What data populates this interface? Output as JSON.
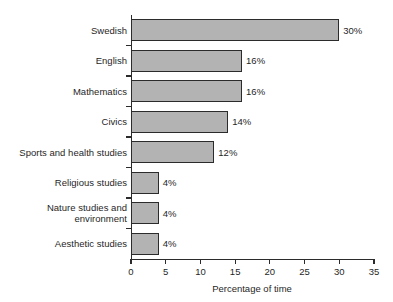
{
  "chart_data": {
    "type": "bar",
    "orientation": "horizontal",
    "title": "",
    "xlabel": "Percentage of time",
    "ylabel": "",
    "xlim": [
      0,
      35
    ],
    "xticks": [
      0,
      5,
      10,
      15,
      20,
      25,
      30,
      35
    ],
    "xtick_labels": [
      "0",
      "5",
      "10",
      "15",
      "20",
      "25",
      "30",
      "35"
    ],
    "grid": false,
    "legend": null,
    "bar_fill_color": "#b3b3b3",
    "bar_edge_color": "#2b2b2b",
    "categories": [
      "Swedish",
      "English",
      "Mathematics",
      "Civics",
      "Sports and health studies",
      "Religious studies",
      "Nature studies and\nenvironment",
      "Aesthetic studies"
    ],
    "values": [
      30,
      16,
      16,
      14,
      12,
      4,
      4,
      4
    ],
    "data_labels": [
      "30%",
      "16%",
      "16%",
      "14%",
      "12%",
      "4%",
      "4%",
      "4%"
    ]
  }
}
